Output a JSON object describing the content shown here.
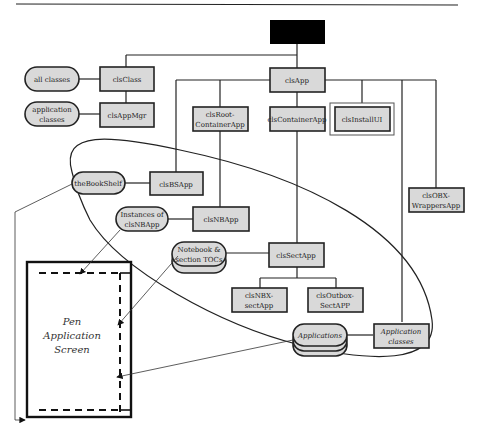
{
  "header_rule": true,
  "root": {
    "label": "",
    "color": "#000000"
  },
  "nodes": {
    "clsClass": "clsClass",
    "clsAppMgr": "clsAppMgr",
    "clsApp": "clsApp",
    "clsRootContainerApp": [
      "clsRoot-",
      "ContainerApp"
    ],
    "clsContainerApp": "clsContainerApp",
    "clsInstallUI": "clsInstallUI",
    "clsBSApp": "clsBSApp",
    "clsNBApp": "clsNBApp",
    "clsSectApp": "clsSectApp",
    "clsNBXsectApp": [
      "clsNBX-",
      "sectApp"
    ],
    "clsOutboxSectAPP": [
      "clsOutbox-",
      "SectAPP"
    ],
    "clsOBXWrappersApp": [
      "clsOBX-",
      "WrappersApp"
    ],
    "applicationClasses": [
      "Application",
      "classes"
    ]
  },
  "instances": {
    "allClasses": "all classes",
    "applicationClassesPill": [
      "application",
      "classes"
    ],
    "theBookShelf": "theBookShelf",
    "instancesNBApp": [
      "Instances of",
      "clsNBApp"
    ],
    "notebookTOCs": [
      "Notebook &",
      "section TOCs"
    ],
    "applications": "Applications"
  },
  "screen": {
    "lines": [
      "Pen",
      "Application",
      "Screen"
    ]
  },
  "colors": {
    "box_fill": "#d9d9d9",
    "stroke": "#222222",
    "root_fill": "#000000"
  }
}
